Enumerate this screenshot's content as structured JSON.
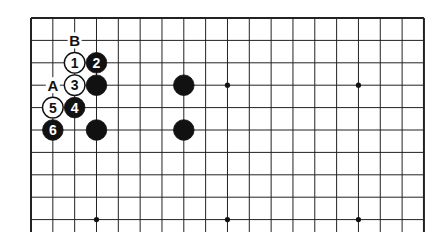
{
  "diagram": {
    "type": "go-board-partial",
    "columns": 19,
    "visible_rows": 10,
    "stones": [
      {
        "color": "white",
        "col": 2,
        "row": 2,
        "label": "1"
      },
      {
        "color": "black",
        "col": 3,
        "row": 2,
        "label": "2"
      },
      {
        "color": "white",
        "col": 2,
        "row": 3,
        "label": "3"
      },
      {
        "color": "black",
        "col": 2,
        "row": 4,
        "label": "4"
      },
      {
        "color": "white",
        "col": 1,
        "row": 4,
        "label": "5"
      },
      {
        "color": "black",
        "col": 1,
        "row": 5,
        "label": "6"
      },
      {
        "color": "black",
        "col": 3,
        "row": 3,
        "label": ""
      },
      {
        "color": "black",
        "col": 3,
        "row": 5,
        "label": ""
      },
      {
        "color": "black",
        "col": 7,
        "row": 3,
        "label": ""
      },
      {
        "color": "black",
        "col": 7,
        "row": 5,
        "label": ""
      }
    ],
    "letters": [
      {
        "text": "B",
        "col": 2,
        "row": 1
      },
      {
        "text": "A",
        "col": 1,
        "row": 3
      }
    ],
    "star_points": [
      {
        "col": 9,
        "row": 3
      },
      {
        "col": 15,
        "row": 3
      },
      {
        "col": 3,
        "row": 9
      },
      {
        "col": 9,
        "row": 9
      },
      {
        "col": 15,
        "row": 9
      }
    ]
  }
}
